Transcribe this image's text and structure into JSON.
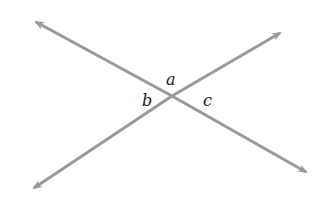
{
  "diagram": {
    "line_color": "#999999",
    "labels": {
      "a": "a",
      "b": "b",
      "c": "c"
    },
    "lines": [
      {
        "name": "line-1",
        "from": [
          36,
          22
        ],
        "to": [
          306,
          172
        ]
      },
      {
        "name": "line-2",
        "from": [
          34,
          188
        ],
        "to": [
          280,
          33
        ]
      }
    ],
    "intersection": [
      172,
      96
    ]
  }
}
